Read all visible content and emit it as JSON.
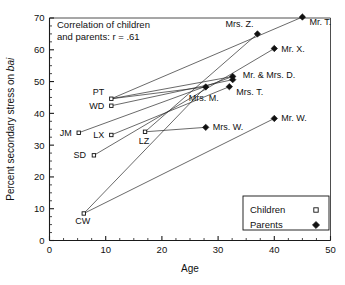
{
  "chart_data": {
    "type": "scatter",
    "title": "",
    "xlabel": "Age",
    "ylabel_prefix": "Percent secondary stress on ",
    "ylabel_italic": "bai",
    "xlim": [
      0,
      50
    ],
    "ylim": [
      0,
      70
    ],
    "xticks": [
      0,
      10,
      20,
      30,
      40,
      50
    ],
    "yticks": [
      0,
      10,
      20,
      30,
      40,
      50,
      60,
      70
    ],
    "xtick_labels": [
      "0",
      "10",
      "20",
      "30",
      "40",
      "50"
    ],
    "ytick_labels": [
      "0",
      "10",
      "20",
      "30",
      "40",
      "50",
      "60",
      "70"
    ],
    "minor_tick_step": 2.5,
    "grid": false,
    "annotation_line1": "Correlation of children",
    "annotation_line2": "and parents: r = .61",
    "correlation_r": 0.61,
    "legend": {
      "position": "bottom-right",
      "entries": [
        {
          "label": "Children",
          "marker": "open-square"
        },
        {
          "label": "Parents",
          "marker": "filled-diamond"
        }
      ]
    },
    "series": [
      {
        "name": "Children",
        "marker": "open-square",
        "points": [
          {
            "label": "CW",
            "x": 6.1,
            "y": 8.5,
            "label_dx": -1,
            "label_dy": 11,
            "anchor": "middle"
          },
          {
            "label": "SD",
            "x": 7.9,
            "y": 26.8,
            "label_dx": -8,
            "label_dy": 3,
            "anchor": "end"
          },
          {
            "label": "JM",
            "x": 5.2,
            "y": 33.9,
            "label_dx": -7,
            "label_dy": 3,
            "anchor": "end"
          },
          {
            "label": "LX",
            "x": 11.0,
            "y": 33.2,
            "label_dx": -7,
            "label_dy": 3,
            "anchor": "end"
          },
          {
            "label": "WD",
            "x": 11.0,
            "y": 42.4,
            "label_dx": -7,
            "label_dy": 3,
            "anchor": "end"
          },
          {
            "label": "PT",
            "x": 11.0,
            "y": 44.6,
            "label_dx": -7,
            "label_dy": -4,
            "anchor": "end"
          },
          {
            "label": "LZ",
            "x": 17.0,
            "y": 34.2,
            "label_dx": -1,
            "label_dy": 12,
            "anchor": "middle"
          }
        ]
      },
      {
        "name": "Parents",
        "marker": "filled-diamond",
        "points": [
          {
            "label": "Mrs. W.",
            "x": 27.8,
            "y": 35.6,
            "label_dx": 7,
            "label_dy": 3,
            "anchor": "start"
          },
          {
            "label": "Mr. W.",
            "x": 40.0,
            "y": 38.4,
            "label_dx": 7,
            "label_dy": 3,
            "anchor": "start"
          },
          {
            "label": "Mrs. M.",
            "x": 27.8,
            "y": 48.3,
            "label_dx": -2,
            "label_dy": 14,
            "anchor": "middle"
          },
          {
            "label": "Mrs. T.",
            "x": 32.0,
            "y": 48.4,
            "label_dx": 7,
            "label_dy": 8,
            "anchor": "start"
          },
          {
            "label": "Mr. & Mrs. D.",
            "x": 32.6,
            "y": 51.6,
            "label_dx": 10,
            "label_dy": 2,
            "anchor": "start"
          },
          {
            "label": "",
            "x": 32.6,
            "y": 50.6,
            "label_dx": 0,
            "label_dy": 0,
            "anchor": "start"
          },
          {
            "label": "Mr. X.",
            "x": 40.0,
            "y": 60.4,
            "label_dx": 7,
            "label_dy": 3,
            "anchor": "start"
          },
          {
            "label": "Mrs. Z.",
            "x": 37.0,
            "y": 65.0,
            "label_dx": -4,
            "label_dy": -7,
            "anchor": "end"
          },
          {
            "label": "Mr. T.",
            "x": 45.0,
            "y": 70.3,
            "label_dx": 7,
            "label_dy": 8,
            "anchor": "start"
          }
        ]
      }
    ],
    "connections": [
      {
        "from": [
          6.1,
          8.5
        ],
        "to": [
          27.8,
          48.3
        ]
      },
      {
        "from": [
          6.1,
          8.5
        ],
        "to": [
          40.0,
          38.4
        ]
      },
      {
        "from": [
          5.2,
          33.9
        ],
        "to": [
          32.6,
          51.6
        ]
      },
      {
        "from": [
          7.9,
          26.8
        ],
        "to": [
          40.0,
          60.4
        ]
      },
      {
        "from": [
          11.0,
          33.2
        ],
        "to": [
          32.0,
          48.4
        ]
      },
      {
        "from": [
          11.0,
          42.4
        ],
        "to": [
          32.6,
          50.6
        ]
      },
      {
        "from": [
          11.0,
          44.6
        ],
        "to": [
          32.6,
          51.6
        ]
      },
      {
        "from": [
          11.0,
          44.6
        ],
        "to": [
          45.0,
          70.3
        ]
      },
      {
        "from": [
          17.0,
          34.2
        ],
        "to": [
          37.0,
          65.0
        ]
      },
      {
        "from": [
          11.0,
          44.6
        ],
        "to": [
          27.8,
          48.3
        ]
      },
      {
        "from": [
          17.0,
          34.2
        ],
        "to": [
          27.8,
          35.6
        ]
      }
    ]
  }
}
